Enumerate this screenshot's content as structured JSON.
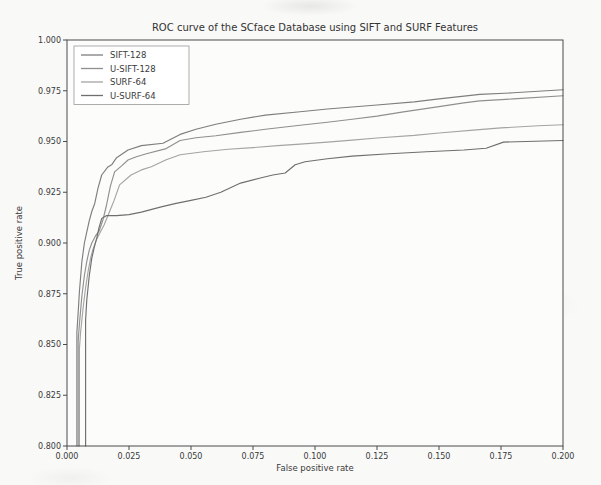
{
  "figure": {
    "kind": "scanned-matplotlib-figure",
    "background": "#f9f9f8",
    "spine_color": "#4b4b4b"
  },
  "chart_data": {
    "type": "line",
    "title": "ROC curve of the SCface Database using SIFT and SURF Features",
    "xlabel": "False positive rate",
    "ylabel": "True positive rate",
    "xlim": [
      0.0,
      0.2
    ],
    "ylim": [
      0.8,
      1.0
    ],
    "grid": false,
    "legend_position": "upper left",
    "xtick_labels": [
      "0.000",
      "0.025",
      "0.050",
      "0.075",
      "0.100",
      "0.125",
      "0.150",
      "0.175",
      "0.200"
    ],
    "ytick_labels": [
      "0.800",
      "0.825",
      "0.850",
      "0.875",
      "0.900",
      "0.925",
      "0.950",
      "0.975",
      "1.000"
    ],
    "series": [
      {
        "name": "SIFT-128",
        "color": "#7e7e7e",
        "points": [
          [
            0.004,
            0.8
          ],
          [
            0.004,
            0.856
          ],
          [
            0.0045,
            0.866
          ],
          [
            0.005,
            0.876
          ],
          [
            0.006,
            0.891
          ],
          [
            0.007,
            0.9
          ],
          [
            0.008,
            0.9055
          ],
          [
            0.009,
            0.911
          ],
          [
            0.01,
            0.9155
          ],
          [
            0.0112,
            0.9196
          ],
          [
            0.0125,
            0.927
          ],
          [
            0.014,
            0.9335
          ],
          [
            0.0165,
            0.9375
          ],
          [
            0.018,
            0.9385
          ],
          [
            0.02,
            0.942
          ],
          [
            0.0246,
            0.9458
          ],
          [
            0.03,
            0.948
          ],
          [
            0.0387,
            0.9491
          ],
          [
            0.0456,
            0.9535
          ],
          [
            0.052,
            0.956
          ],
          [
            0.06,
            0.9585
          ],
          [
            0.07,
            0.961
          ],
          [
            0.08,
            0.963
          ],
          [
            0.094,
            0.9647
          ],
          [
            0.105,
            0.966
          ],
          [
            0.115,
            0.967
          ],
          [
            0.125,
            0.968
          ],
          [
            0.14,
            0.9695
          ],
          [
            0.15,
            0.971
          ],
          [
            0.1665,
            0.9732
          ],
          [
            0.18,
            0.974
          ],
          [
            0.2,
            0.9755
          ]
        ]
      },
      {
        "name": "U-SIFT-128",
        "color": "#8f8f8f",
        "points": [
          [
            0.0045,
            0.8
          ],
          [
            0.0045,
            0.852
          ],
          [
            0.005,
            0.86
          ],
          [
            0.006,
            0.874
          ],
          [
            0.007,
            0.884
          ],
          [
            0.008,
            0.891
          ],
          [
            0.009,
            0.8965
          ],
          [
            0.01,
            0.9
          ],
          [
            0.0115,
            0.9035
          ],
          [
            0.013,
            0.906
          ],
          [
            0.0145,
            0.9115
          ],
          [
            0.0158,
            0.918
          ],
          [
            0.0175,
            0.928
          ],
          [
            0.0192,
            0.935
          ],
          [
            0.022,
            0.938
          ],
          [
            0.0246,
            0.9409
          ],
          [
            0.028,
            0.9425
          ],
          [
            0.032,
            0.944
          ],
          [
            0.04,
            0.9465
          ],
          [
            0.0456,
            0.9505
          ],
          [
            0.052,
            0.9518
          ],
          [
            0.06,
            0.9528
          ],
          [
            0.07,
            0.9545
          ],
          [
            0.08,
            0.956
          ],
          [
            0.094,
            0.958
          ],
          [
            0.105,
            0.9595
          ],
          [
            0.115,
            0.961
          ],
          [
            0.125,
            0.9625
          ],
          [
            0.135,
            0.9645
          ],
          [
            0.15,
            0.9672
          ],
          [
            0.16,
            0.969
          ],
          [
            0.1665,
            0.97
          ],
          [
            0.18,
            0.971
          ],
          [
            0.2,
            0.9725
          ]
        ]
      },
      {
        "name": "SURF-64",
        "color": "#a4a4a4",
        "points": [
          [
            0.005,
            0.8
          ],
          [
            0.005,
            0.848
          ],
          [
            0.0055,
            0.856
          ],
          [
            0.0065,
            0.868
          ],
          [
            0.0075,
            0.878
          ],
          [
            0.0085,
            0.886
          ],
          [
            0.0095,
            0.8925
          ],
          [
            0.0105,
            0.897
          ],
          [
            0.012,
            0.902
          ],
          [
            0.0135,
            0.9055
          ],
          [
            0.015,
            0.909
          ],
          [
            0.017,
            0.915
          ],
          [
            0.019,
            0.921
          ],
          [
            0.0212,
            0.9286
          ],
          [
            0.0258,
            0.9335
          ],
          [
            0.03,
            0.936
          ],
          [
            0.034,
            0.9376
          ],
          [
            0.04,
            0.941
          ],
          [
            0.0456,
            0.9435
          ],
          [
            0.055,
            0.945
          ],
          [
            0.065,
            0.9462
          ],
          [
            0.075,
            0.947
          ],
          [
            0.085,
            0.948
          ],
          [
            0.094,
            0.9487
          ],
          [
            0.105,
            0.9497
          ],
          [
            0.115,
            0.9507
          ],
          [
            0.125,
            0.9517
          ],
          [
            0.14,
            0.953
          ],
          [
            0.15,
            0.9542
          ],
          [
            0.165,
            0.9557
          ],
          [
            0.175,
            0.9567
          ],
          [
            0.19,
            0.9578
          ],
          [
            0.2,
            0.9583
          ]
        ]
      },
      {
        "name": "U-SURF-64",
        "color": "#6f6f6f",
        "points": [
          [
            0.0075,
            0.8
          ],
          [
            0.0075,
            0.862
          ],
          [
            0.008,
            0.872
          ],
          [
            0.009,
            0.884
          ],
          [
            0.01,
            0.8925
          ],
          [
            0.011,
            0.898
          ],
          [
            0.012,
            0.9025
          ],
          [
            0.013,
            0.908
          ],
          [
            0.014,
            0.912
          ],
          [
            0.016,
            0.9135
          ],
          [
            0.02,
            0.9135
          ],
          [
            0.025,
            0.914
          ],
          [
            0.03,
            0.9152
          ],
          [
            0.038,
            0.9178
          ],
          [
            0.044,
            0.9195
          ],
          [
            0.05,
            0.921
          ],
          [
            0.056,
            0.9225
          ],
          [
            0.062,
            0.925
          ],
          [
            0.07,
            0.9295
          ],
          [
            0.078,
            0.932
          ],
          [
            0.083,
            0.9335
          ],
          [
            0.088,
            0.9345
          ],
          [
            0.092,
            0.9385
          ],
          [
            0.096,
            0.94
          ],
          [
            0.105,
            0.9415
          ],
          [
            0.115,
            0.9428
          ],
          [
            0.13,
            0.944
          ],
          [
            0.145,
            0.945
          ],
          [
            0.16,
            0.9458
          ],
          [
            0.169,
            0.9467
          ],
          [
            0.176,
            0.9497
          ],
          [
            0.185,
            0.95
          ],
          [
            0.2,
            0.9505
          ]
        ]
      }
    ]
  }
}
